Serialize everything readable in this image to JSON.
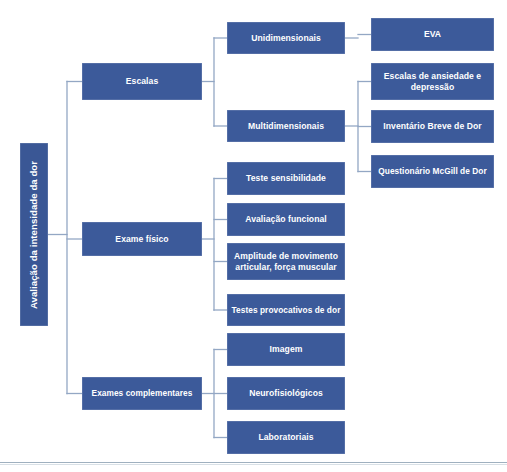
{
  "diagram": {
    "title": "Avaliação da intensidade da dor",
    "accent_color": "#3c5a9a",
    "connector_color": "#93a7c4",
    "background_color": "#ffffff",
    "root": {
      "label": "Avaliação da intensidade da dor"
    },
    "level2": [
      {
        "label": "Escalas"
      },
      {
        "label": "Exame físico"
      },
      {
        "label": "Exames complementares"
      }
    ],
    "escalas_children": [
      {
        "label": "Unidimensionais"
      },
      {
        "label": "Multidimensionais"
      }
    ],
    "unidimensionais_children": [
      {
        "label": "EVA"
      }
    ],
    "multidimensionais_children": [
      {
        "label": "Escalas de ansiedade e depressão"
      },
      {
        "label": "Inventário Breve de Dor"
      },
      {
        "label": "Questionário McGill de Dor"
      }
    ],
    "exame_fisico_children": [
      {
        "label": "Teste sensibilidade"
      },
      {
        "label": "Avaliação funcional"
      },
      {
        "label": "Amplitude de movimento articular, força muscular"
      },
      {
        "label": "Testes provocativos de dor"
      }
    ],
    "exames_complementares_children": [
      {
        "label": "Imagem"
      },
      {
        "label": "Neurofisiológicos"
      },
      {
        "label": "Laboratoriais"
      }
    ]
  }
}
